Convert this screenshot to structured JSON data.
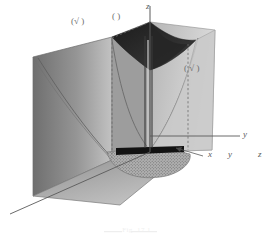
{
  "figure": {
    "caption": "Fig. 17.1",
    "axes": {
      "z_label": "z",
      "y_label": "y",
      "x_label": "x",
      "legend_x": "x",
      "legend_y": "y",
      "legend_z": "z"
    },
    "point_labels": [
      {
        "id": "left-point",
        "text": "(√  )"
      },
      {
        "id": "top-point",
        "text": "(   )"
      },
      {
        "id": "right-point",
        "text": "( √ )"
      }
    ],
    "colors": {
      "background": "#ffffff",
      "surface_dark": "#2a2a2a",
      "surface_mid": "#8a8a8a",
      "surface_light": "#bdbdbd",
      "surface_pale": "#d2d2d2",
      "stipple": "#9a9a9a",
      "line": "#555555",
      "axis": "#5a5a5a",
      "dashed": "#6a6a6a"
    }
  }
}
